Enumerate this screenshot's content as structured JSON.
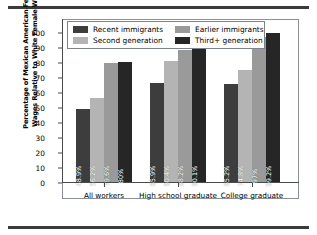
{
  "chart_data": {
    "type": "bar",
    "title": "",
    "subtitle": "",
    "xlabel": "",
    "ylabel": "Percentage of Mexican American Female Wages Relative to White Female Wages",
    "ylabel_line1": "Percentage of Mexican American Female",
    "ylabel_line2": "Wages Relative to White Female Wages",
    "ylim": [
      0,
      100
    ],
    "yticks": [
      "0",
      "10",
      "20",
      "30",
      "40",
      "50",
      "60",
      "70",
      "80",
      "90",
      "100"
    ],
    "ytick_values": [
      0,
      10,
      20,
      30,
      40,
      50,
      60,
      70,
      80,
      90,
      100
    ],
    "grid": false,
    "legend_position": "upper-left-inside",
    "categories": [
      "All workers",
      "High school graduate",
      "College graduate"
    ],
    "series": [
      {
        "name": "Recent immigrants",
        "color": "#3d3d3d",
        "values": [
          48.9,
          65.9,
          65.2
        ],
        "labels": [
          "48.9%",
          "65.9%",
          "65.2%"
        ]
      },
      {
        "name": "Second generation",
        "color": "#b4b4b4",
        "values": [
          56.2,
          80.4,
          74.8
        ],
        "labels": [
          "56.2%",
          "80.4%",
          "74.8%"
        ]
      },
      {
        "name": "Earlier immigrants",
        "color": "#9a9a9a",
        "values": [
          79.6,
          88.2,
          97.0
        ],
        "labels": [
          "79.6%",
          "88.2%",
          "97%"
        ]
      },
      {
        "name": "Third+ generation",
        "color": "#262626",
        "values": [
          80.0,
          90.1,
          99.2
        ],
        "labels": [
          "80%",
          "90.1%",
          "99.2%"
        ]
      }
    ],
    "legend_order": [
      "Recent immigrants",
      "Earlier immigrants",
      "Second generation",
      "Third+ generation"
    ]
  },
  "legend": {
    "items": [
      {
        "label": "Recent immigrants",
        "color": "#3d3d3d"
      },
      {
        "label": "Earlier immigrants",
        "color": "#9a9a9a"
      },
      {
        "label": "Second generation",
        "color": "#b4b4b4"
      },
      {
        "label": "Third+ generation",
        "color": "#262626"
      }
    ]
  }
}
